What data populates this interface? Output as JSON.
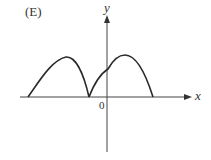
{
  "figure": {
    "panel_label": "(E)",
    "axes": {
      "x_label": "x",
      "y_label": "y",
      "origin_label": "0"
    },
    "colors": {
      "stroke": "#2a2a2a",
      "axis": "#444444",
      "text": "#333333",
      "background": "#ffffff"
    },
    "curve": {
      "description": "Two arch-shaped humps; left hump from x-axis rising to a peak then falling to a cusp on x-axis left of origin; right hump rising from the cusp through the y-axis to a peak right of origin then falling back to the x-axis",
      "segments": [
        {
          "name": "left-arch",
          "start": "x-axis far left",
          "peak": "left of origin",
          "end": "cusp on x-axis left of origin"
        },
        {
          "name": "right-arch",
          "start": "cusp on x-axis left of origin",
          "crosses_y_axis": "positive y",
          "peak": "right of origin",
          "end": "x-axis right of origin"
        }
      ]
    }
  }
}
